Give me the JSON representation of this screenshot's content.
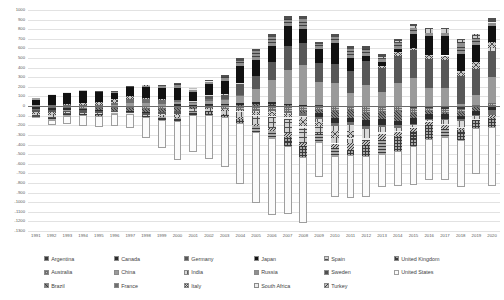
{
  "chart_data": {
    "type": "bar",
    "stacked": true,
    "title": "",
    "subtitle": "",
    "xlabel": "",
    "ylabel": "",
    "ylim": [
      -1300,
      1000
    ],
    "ytick_step": 100,
    "grid": true,
    "legend_position": "bottom",
    "categories": [
      "1991",
      "1992",
      "1993",
      "1994",
      "1995",
      "1996",
      "1997",
      "1998",
      "1999",
      "2000",
      "2001",
      "2002",
      "2003",
      "2004",
      "2005",
      "2006",
      "2007",
      "2008",
      "2009",
      "2010",
      "2011",
      "2012",
      "2013",
      "2014",
      "2015",
      "2016",
      "2017",
      "2018",
      "2019",
      "2020"
    ],
    "ytick_labels": [
      "1000",
      "900",
      "800",
      "700",
      "600",
      "500",
      "400",
      "300",
      "200",
      "100",
      "0",
      "-100",
      "-200",
      "-300",
      "-400",
      "-500",
      "-600",
      "-700",
      "-800",
      "-900",
      "-1000",
      "-1100",
      "-1200",
      "-1300"
    ],
    "series": [
      {
        "name": "Argentina",
        "key": "argentina",
        "color": "#3a3a3a",
        "values": [
          -0.6,
          -5.5,
          -8,
          -10.9,
          -5,
          -6.8,
          -12.1,
          -14.5,
          -11.9,
          -8.9,
          -3.8,
          8.7,
          8,
          3.2,
          5.3,
          7.8,
          7.4,
          6.8,
          8.3,
          -1.6,
          -5,
          -2.1,
          -13.1,
          -9.2,
          -17.6,
          -15,
          -31.6,
          -27.3,
          -3.5,
          3.3
        ]
      },
      {
        "name": "Australia",
        "key": "australia",
        "color": "#bdbdbd",
        "values": [
          -11.2,
          -11.4,
          -10.2,
          -16.7,
          -19.3,
          -15.8,
          -12.6,
          -18,
          -22.4,
          -15.1,
          -7.5,
          -16.2,
          -28.6,
          -39.1,
          -41.6,
          -41.4,
          -58.2,
          -47.8,
          -44.7,
          -44.6,
          -38.4,
          -65.5,
          -48.6,
          -42.6,
          -56.8,
          -41.3,
          -35.7,
          -29.8,
          10.2,
          25.5
        ]
      },
      {
        "name": "Brazil",
        "key": "brazil",
        "color": "#7d7d7d",
        "values": [
          -1.4,
          6.1,
          -0.6,
          -1.8,
          -18.4,
          -23.5,
          -30.5,
          -33.4,
          -25.3,
          -24.2,
          -23.2,
          -7.6,
          4.2,
          11.7,
          14,
          13.6,
          1.6,
          -28.2,
          -24.3,
          -75.8,
          -77.0,
          -74.2,
          -74.8,
          -104.2,
          -54.5,
          -24.2,
          -15.0,
          -41.5,
          -50.7,
          -12.5
        ]
      },
      {
        "name": "Canada",
        "key": "canada",
        "color": "#2b2b2b",
        "values": [
          -22.3,
          -21.1,
          -21.7,
          -13.1,
          -4.4,
          3.4,
          -8.2,
          -7.7,
          1.7,
          19.7,
          16.2,
          12.6,
          10.5,
          21.4,
          21.4,
          18.3,
          11.1,
          4.5,
          -40.9,
          -58.0,
          -49.4,
          -65.7,
          -59.5,
          -44.7,
          -55.4,
          -49.3,
          -47.0,
          -40.0,
          -35.3,
          -29.1
        ]
      },
      {
        "name": "China",
        "key": "china",
        "color": "#9a9a9a",
        "values": [
          13.3,
          6.4,
          -11.9,
          7.7,
          1.6,
          7.2,
          37,
          31.5,
          21.1,
          20.5,
          17.4,
          35.4,
          43,
          68.9,
          132.4,
          231.8,
          353.2,
          420.6,
          243.3,
          237.8,
          136.1,
          215.4,
          148.2,
          236.0,
          293.0,
          191.3,
          188.7,
          24.1,
          102.9,
          274.0
        ]
      },
      {
        "name": "France",
        "key": "france",
        "color": "#6f6f6f",
        "values": [
          -6.1,
          3.9,
          9.2,
          7.4,
          10.8,
          20.6,
          37.8,
          37.6,
          42.0,
          18.0,
          21.5,
          14.2,
          8.2,
          9.5,
          -10.3,
          -10.3,
          -18.9,
          -32.5,
          -25.4,
          -22.3,
          -29.3,
          -31.0,
          -23.6,
          -26.2,
          -9.1,
          -12.4,
          -16.6,
          -18.0,
          -17.8,
          -51.8
        ]
      },
      {
        "name": "Germany",
        "key": "germany",
        "color": "#585858",
        "values": [
          -18.4,
          -19.1,
          -13.9,
          -29.6,
          -29.6,
          -13.4,
          -9.5,
          -15.1,
          -26.8,
          -32.5,
          0.4,
          40.8,
          46.3,
          127.1,
          140.8,
          182.4,
          248.9,
          226.1,
          197.8,
          196.2,
          232.7,
          249.9,
          247.4,
          283.6,
          288.8,
          297.4,
          287.0,
          293.4,
          275.0,
          273.3
        ]
      },
      {
        "name": "India",
        "key": "india",
        "color": "#d9d9d9",
        "values": [
          -1.2,
          -3.5,
          -1.2,
          -1.7,
          -5.6,
          -5.9,
          -2.9,
          -6.9,
          -3.2,
          -4.6,
          1.4,
          7.1,
          8.8,
          0.8,
          -10.3,
          -9.3,
          -8.1,
          -30.8,
          -26.2,
          -54.5,
          -62.5,
          -91.5,
          -49.2,
          -27.5,
          -22.4,
          -14.4,
          -38.2,
          -57.2,
          -29.7,
          24.0
        ]
      },
      {
        "name": "Italy",
        "key": "italy",
        "color": "#c8c8c8",
        "values": [
          -24.4,
          -28.8,
          8.0,
          13.2,
          25.1,
          39.6,
          32.4,
          19.9,
          8.1,
          -5.8,
          -0.6,
          -9.4,
          -19.4,
          -16.8,
          -29.4,
          -37.5,
          -29.9,
          -66.8,
          -41.9,
          -72.0,
          -67.3,
          -6.5,
          20.0,
          40.4,
          27.2,
          47.9,
          50.7,
          51.7,
          66.7,
          68.6
        ]
      },
      {
        "name": "Japan",
        "key": "japan",
        "color": "#111111",
        "values": [
          68.2,
          112.4,
          131.9,
          130.3,
          111.0,
          65.8,
          96.6,
          119.1,
          114.5,
          130.7,
          87.8,
          112.6,
          136.2,
          172.1,
          170.1,
          174.5,
          212.1,
          142.6,
          145.3,
          220.9,
          129.8,
          59.7,
          45.9,
          36.8,
          136.4,
          197.1,
          203.5,
          177.1,
          176.3,
          165.4
        ]
      },
      {
        "name": "Russia",
        "key": "russia",
        "color": "#8f8f8f",
        "values": [
          0,
          0,
          0,
          7.8,
          7.0,
          10.8,
          -0.1,
          0.2,
          24.6,
          46.8,
          33.9,
          29.1,
          35.4,
          59.5,
          84.4,
          92.3,
          72.2,
          103.9,
          50.4,
          67.5,
          97.3,
          71.3,
          33.4,
          57.5,
          67.8,
          24.5,
          33.3,
          115.7,
          65.3,
          36.0
        ]
      },
      {
        "name": "South Africa",
        "key": "southafrica",
        "color": "#ececec",
        "values": [
          2.0,
          2.0,
          1.3,
          -0.1,
          -2.2,
          -1.9,
          -2.2,
          -2.2,
          -0.5,
          -0.2,
          0.6,
          0.7,
          -2.0,
          -6.7,
          -8.6,
          -13.8,
          -20.0,
          -19.9,
          -8.1,
          -5.6,
          -9.0,
          -20.1,
          -21.1,
          -18.5,
          -13.9,
          -9.5,
          -8.8,
          -13.4,
          -10.6,
          7.5
        ]
      },
      {
        "name": "Spain",
        "key": "spain",
        "color": "#cfcfcf",
        "values": [
          -19.8,
          -21.3,
          -6.2,
          -6.0,
          -0.4,
          -0.2,
          1.3,
          -4.5,
          -18.1,
          -23.2,
          -24.0,
          -22.4,
          -31.1,
          -55.2,
          -83.2,
          -110.8,
          -144.5,
          -154.1,
          -69.5,
          -55.0,
          -47.4,
          -4.6,
          20.8,
          17.9,
          23.0,
          39.2,
          34.0,
          27.7,
          29.8,
          8.3
        ]
      },
      {
        "name": "Sweden",
        "key": "sweden",
        "color": "#4f4f4f",
        "values": [
          -4.3,
          -8.9,
          -3.8,
          1.5,
          3.9,
          5.1,
          5.9,
          7.9,
          8.8,
          9.1,
          10.0,
          12.1,
          19.3,
          24.0,
          20.6,
          27.0,
          32.7,
          37.1,
          26.7,
          28.3,
          30.1,
          28.1,
          26.1,
          21.1,
          16.0,
          10.4,
          14.0,
          12.5,
          12.6,
          29.0
        ]
      },
      {
        "name": "Turkey",
        "key": "turkey",
        "color": "#bfbfbf",
        "values": [
          0.3,
          -0.9,
          -6.4,
          2.6,
          -2.3,
          -2.4,
          -2.6,
          2.0,
          -0.9,
          -9.9,
          3.8,
          -0.6,
          -7.6,
          -14.4,
          -21.4,
          -31.8,
          -37.8,
          -40.4,
          -12.2,
          -45.4,
          -75.0,
          -48.0,
          -63.6,
          -43.6,
          -32.1,
          -33.1,
          -40.6,
          -20.7,
          6.8,
          -35.5
        ]
      },
      {
        "name": "United Kingdom",
        "key": "unitedkingdom",
        "color": "#a8a8a8",
        "values": [
          -19.1,
          -22.8,
          -17.2,
          -10.0,
          -14.3,
          -13.7,
          -3.5,
          -10.4,
          -39.0,
          -35.2,
          -31.7,
          -34.6,
          -29.3,
          -48.5,
          -62.6,
          -77.3,
          -94.1,
          -113.0,
          -75.6,
          -82.2,
          -53.7,
          -106.5,
          -142.0,
          -151.7,
          -148.8,
          -139.9,
          -92.1,
          -102.0,
          -84.6,
          -91.8
        ]
      },
      {
        "name": "United States",
        "key": "unitedstates",
        "color": "#fbfbfb",
        "values": [
          2.9,
          -51.6,
          -84.8,
          -121.6,
          -113.6,
          -124.8,
          -140.7,
          -215.1,
          -286.6,
          -401.9,
          -384.7,
          -461.3,
          -519.1,
          -628.5,
          -745.8,
          -805.9,
          -711.0,
          -681.3,
          -372.5,
          -431.3,
          -445.7,
          -426.2,
          -348.8,
          -365.2,
          -407.8,
          -428.3,
          -439.6,
          -491.0,
          -472.1,
          -616.1
        ]
      }
    ]
  }
}
